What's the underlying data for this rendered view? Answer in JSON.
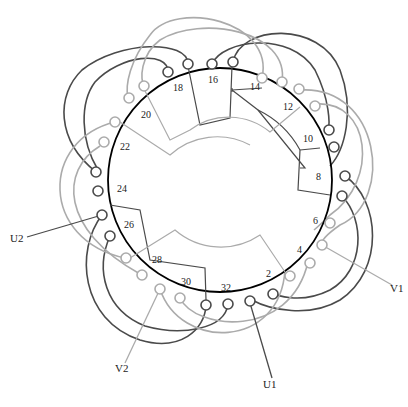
{
  "diagram": {
    "type": "stator-winding-diagram",
    "slot_labels": [
      "2",
      "4",
      "6",
      "8",
      "10",
      "12",
      "14",
      "16",
      "18",
      "20",
      "22",
      "24",
      "26",
      "28",
      "30",
      "32"
    ],
    "terminals": [
      "U1",
      "U2",
      "V1",
      "V2"
    ],
    "colors": {
      "phase_u": "#3a3a3a",
      "phase_v": "#a8a8a8",
      "stator_ring": "#000000"
    }
  }
}
